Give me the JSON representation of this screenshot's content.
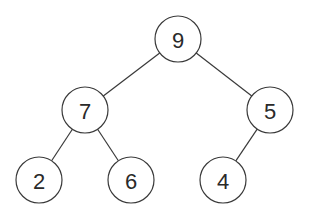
{
  "diagram": {
    "type": "binary-tree",
    "nodes": [
      {
        "id": "n9",
        "label": "9",
        "cx": 178,
        "cy": 39
      },
      {
        "id": "n7",
        "label": "7",
        "cx": 85,
        "cy": 110
      },
      {
        "id": "n5",
        "label": "5",
        "cx": 270,
        "cy": 110
      },
      {
        "id": "n2",
        "label": "2",
        "cx": 39,
        "cy": 180
      },
      {
        "id": "n6",
        "label": "6",
        "cx": 131,
        "cy": 180
      },
      {
        "id": "n4",
        "label": "4",
        "cx": 223,
        "cy": 180
      }
    ],
    "edges": [
      {
        "from": "n9",
        "to": "n7"
      },
      {
        "from": "n9",
        "to": "n5"
      },
      {
        "from": "n7",
        "to": "n2"
      },
      {
        "from": "n7",
        "to": "n6"
      },
      {
        "from": "n5",
        "to": "n4"
      }
    ],
    "node_radius": 23
  }
}
